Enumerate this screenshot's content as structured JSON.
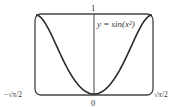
{
  "chart_data": {
    "type": "line",
    "title": "",
    "function_label": "y = sin(x²)",
    "xlabel": "",
    "ylabel": "",
    "xlim": [
      -1.2533,
      1.2533
    ],
    "ylim": [
      0,
      1
    ],
    "x_tick_labels": {
      "left": "−√π/2",
      "center": "0",
      "right": "√π/2"
    },
    "y_tick_labels": {
      "top": "1"
    },
    "grid": false,
    "series": [
      {
        "name": "y = sin(x²)",
        "expression": "sin(x^2)",
        "samples": 121
      }
    ]
  },
  "colors": {
    "curve": "#2a2a2a",
    "frame": "#444444",
    "axis": "#444444",
    "text": "#333333"
  }
}
